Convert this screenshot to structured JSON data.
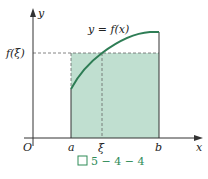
{
  "figure": {
    "caption_prefix": "图",
    "caption_number": "5 − 4 − 4",
    "curve_label": "y = f(x)",
    "y_axis_label": "y",
    "x_axis_label": "x",
    "origin_label": "O",
    "tick_labels": {
      "a": "a",
      "xi": "ξ",
      "b": "b",
      "f_xi": "f(ξ)"
    },
    "colors": {
      "fill": "#b9dccb",
      "curve": "#2e7d55",
      "axes": "#333333",
      "dashed": "#666666",
      "caption": "#2e8b57"
    }
  }
}
